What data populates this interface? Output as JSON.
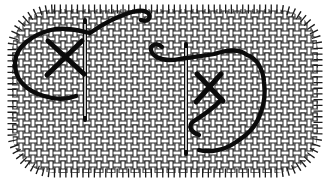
{
  "figure": {
    "alt": "Engraved needlework illustration: two cross stitches being worked on woven canvas. On the left, a completed X stitch is encircled by a loose loop of working thread beside an upright needle; on the right, a second X stitch is in progress with the thread end curled on the fabric and a large loop of thread trailing around a second upright needle. The canvas patch has rounded, frayed edges.",
    "stitch_count": "2"
  },
  "colors": {
    "ink": "#0b0b0b",
    "weave_line": "#1c1c1c",
    "paper": "#ffffff"
  },
  "parts": {
    "fabric": "woven canvas patch",
    "fringe": "frayed thread ends around edge",
    "left_stitch": "completed cross stitch with encircling working thread",
    "left_needle": "upright needle",
    "right_stitch": "cross stitch in progress with curled thread end and trailing loop",
    "right_needle": "upright needle with thread looped around it"
  }
}
